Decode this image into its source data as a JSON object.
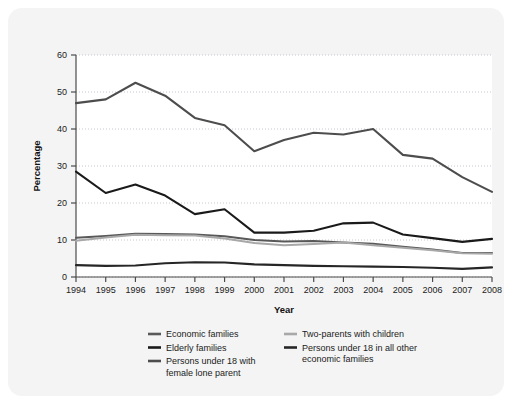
{
  "figure": {
    "background_color": "#f4f4f4",
    "plot_background_color": "#ffffff"
  },
  "chart_data": {
    "type": "line",
    "title": "",
    "xlabel": "Year",
    "ylabel": "Percentage",
    "ylim": [
      0,
      60
    ],
    "yticks": [
      0,
      10,
      20,
      30,
      40,
      50,
      60
    ],
    "grid": true,
    "legend_position": "bottom",
    "categories": [
      "1994",
      "1995",
      "1996",
      "1997",
      "1998",
      "1999",
      "2000",
      "2001",
      "2002",
      "2003",
      "2004",
      "2005",
      "2006",
      "2007",
      "2008"
    ],
    "x": [
      1994,
      1995,
      1996,
      1997,
      1998,
      1999,
      2000,
      2001,
      2002,
      2003,
      2004,
      2005,
      2006,
      2007,
      2008
    ],
    "series": [
      {
        "name": "Persons under 18 with female lone parent",
        "color": "#4d4d4d",
        "width": 2.1,
        "values": [
          47.0,
          48.0,
          52.5,
          49.0,
          43.0,
          41.0,
          34.0,
          37.0,
          39.0,
          38.5,
          40.0,
          33.0,
          32.0,
          27.0,
          23.0
        ]
      },
      {
        "name": "Elderly families",
        "color": "#1a1a1a",
        "width": 2.1,
        "values": [
          28.5,
          22.7,
          25.0,
          22.0,
          17.0,
          18.3,
          12.0,
          12.0,
          12.5,
          14.5,
          14.7,
          11.5,
          10.5,
          9.5,
          10.3
        ]
      },
      {
        "name": "Economic families",
        "color": "#595959",
        "width": 2.0,
        "values": [
          10.6,
          11.1,
          11.7,
          11.6,
          11.5,
          11.0,
          10.0,
          9.6,
          9.7,
          9.3,
          9.0,
          8.2,
          7.4,
          6.5,
          6.5
        ]
      },
      {
        "name": "Two-parents with children",
        "color": "#a8a8a8",
        "width": 2.0,
        "values": [
          9.8,
          10.7,
          11.4,
          11.3,
          11.2,
          10.4,
          9.2,
          8.6,
          8.9,
          9.3,
          8.6,
          7.9,
          7.2,
          6.4,
          6.3
        ]
      },
      {
        "name": "Persons under 18 in all other economic families",
        "color": "#262626",
        "width": 2.1,
        "values": [
          3.2,
          3.0,
          3.1,
          3.7,
          4.0,
          3.9,
          3.4,
          3.2,
          3.0,
          2.9,
          2.8,
          2.7,
          2.5,
          2.2,
          2.6
        ]
      }
    ]
  },
  "legend": {
    "column_left": [
      {
        "label": "Economic families",
        "color": "#595959"
      },
      {
        "label": "Elderly families",
        "color": "#1a1a1a"
      },
      {
        "label": "Persons under 18 with",
        "label2": "female lone parent",
        "color": "#4d4d4d"
      }
    ],
    "column_right": [
      {
        "label": "Two-parents with children",
        "color": "#a8a8a8"
      },
      {
        "label": "Persons under 18 in all other",
        "label2": "economic families",
        "color": "#262626"
      }
    ]
  },
  "labels": {
    "y_axis_title": "Percentage",
    "x_axis_title": "Year",
    "ytick_0": "0",
    "ytick_10": "10",
    "ytick_20": "20",
    "ytick_30": "30",
    "ytick_40": "40",
    "ytick_50": "50",
    "ytick_60": "60",
    "legend_economic_families": "Economic families",
    "legend_elderly_families": "Elderly families",
    "legend_persons_lone_parent_1": "Persons under 18 with",
    "legend_persons_lone_parent_2": "female lone parent",
    "legend_two_parents": "Two-parents with children",
    "legend_persons_other_1": "Persons under 18 in all other",
    "legend_persons_other_2": "economic families"
  }
}
